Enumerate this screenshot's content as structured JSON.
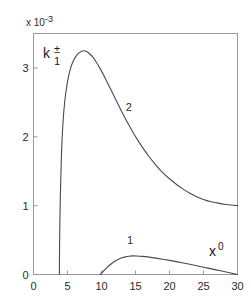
{
  "chart_data": {
    "type": "line",
    "title": "",
    "subtitle": "",
    "xlabel": "x⁰",
    "xlabel_base": "x",
    "xlabel_sup": "0",
    "ylabel": "k₁±",
    "ylabel_base": "k",
    "ylabel_sup": "±",
    "ylabel_sub": "1",
    "y_multiplier": "x 10",
    "y_multiplier_exp": "-3",
    "xlim": [
      0,
      30
    ],
    "ylim": [
      0,
      3.5
    ],
    "xticks": [
      0,
      5,
      10,
      15,
      20,
      25,
      30
    ],
    "xticklabels": [
      "0",
      "5",
      "10",
      "15",
      "20",
      "25",
      "30"
    ],
    "yticks": [
      0,
      1,
      2,
      3
    ],
    "yticklabels": [
      "0",
      "1",
      "2",
      "3"
    ],
    "grid": false,
    "legend": "inline-annotations",
    "curve_color": "#4a4a4a",
    "axis_color": "#9a9a9a",
    "series": [
      {
        "name": "1",
        "annotation": "1",
        "annotation_x": 14.2,
        "annotation_y": 0.44,
        "onset_x": 9.8,
        "peak_x": 14.6,
        "peak_y": 0.27,
        "end_x": 30,
        "end_y": 0.0,
        "points": [
          [
            9.8,
            0.0
          ],
          [
            10.2,
            0.04
          ],
          [
            10.6,
            0.08
          ],
          [
            11.0,
            0.12
          ],
          [
            11.5,
            0.16
          ],
          [
            12.0,
            0.195
          ],
          [
            12.5,
            0.222
          ],
          [
            13.0,
            0.242
          ],
          [
            13.5,
            0.256
          ],
          [
            14.0,
            0.265
          ],
          [
            14.6,
            0.27
          ],
          [
            15.2,
            0.269
          ],
          [
            16.0,
            0.263
          ],
          [
            17.0,
            0.252
          ],
          [
            18.0,
            0.238
          ],
          [
            19.0,
            0.222
          ],
          [
            20.0,
            0.205
          ],
          [
            21.0,
            0.187
          ],
          [
            22.0,
            0.168
          ],
          [
            23.0,
            0.148
          ],
          [
            24.0,
            0.127
          ],
          [
            25.0,
            0.106
          ],
          [
            26.0,
            0.085
          ],
          [
            27.0,
            0.064
          ],
          [
            28.0,
            0.043
          ],
          [
            29.0,
            0.021
          ],
          [
            30.0,
            0.0
          ]
        ]
      },
      {
        "name": "2",
        "annotation": "2",
        "annotation_x": 14.0,
        "annotation_y": 2.38,
        "onset_x": 3.8,
        "peak_x": 7.4,
        "peak_y": 3.25,
        "end_x": 30,
        "end_y": 1.0,
        "points": [
          [
            3.8,
            0.0
          ],
          [
            3.85,
            0.55
          ],
          [
            3.95,
            1.15
          ],
          [
            4.1,
            1.7
          ],
          [
            4.3,
            2.15
          ],
          [
            4.6,
            2.52
          ],
          [
            5.0,
            2.8
          ],
          [
            5.4,
            2.98
          ],
          [
            5.8,
            3.09
          ],
          [
            6.2,
            3.16
          ],
          [
            6.6,
            3.21
          ],
          [
            7.0,
            3.24
          ],
          [
            7.4,
            3.25
          ],
          [
            7.8,
            3.24
          ],
          [
            8.2,
            3.21
          ],
          [
            8.7,
            3.16
          ],
          [
            9.2,
            3.09
          ],
          [
            9.8,
            2.99
          ],
          [
            10.4,
            2.88
          ],
          [
            11.0,
            2.76
          ],
          [
            11.7,
            2.62
          ],
          [
            12.4,
            2.48
          ],
          [
            13.1,
            2.34
          ],
          [
            13.8,
            2.21
          ],
          [
            14.6,
            2.07
          ],
          [
            15.4,
            1.94
          ],
          [
            16.2,
            1.82
          ],
          [
            17.0,
            1.71
          ],
          [
            18.0,
            1.59
          ],
          [
            19.0,
            1.48
          ],
          [
            20.0,
            1.39
          ],
          [
            21.0,
            1.31
          ],
          [
            22.0,
            1.24
          ],
          [
            23.0,
            1.18
          ],
          [
            24.0,
            1.13
          ],
          [
            25.0,
            1.09
          ],
          [
            26.0,
            1.06
          ],
          [
            27.0,
            1.04
          ],
          [
            28.0,
            1.02
          ],
          [
            29.0,
            1.01
          ],
          [
            30.0,
            1.0
          ]
        ]
      }
    ]
  }
}
